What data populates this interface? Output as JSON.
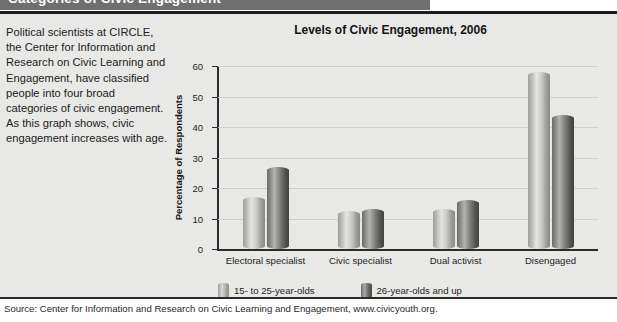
{
  "header": {
    "title": "Categories of Civic Engagement"
  },
  "blurb": {
    "text": "Political scientists at CIRCLE, the Center for Information and Research on Civic Learning and Engagement, have classified people into four broad categories of civic engagement. As this graph shows, civic engagement increases with age."
  },
  "source": {
    "text": "Source: Center for Information and Research on Civic Learning and Engagement, www.civicyouth.org."
  },
  "legend": {
    "items": [
      {
        "label": "15- to 25-year-olds",
        "swatch": "light"
      },
      {
        "label": "26-year-olds and up",
        "swatch": "dark"
      }
    ]
  },
  "colors": {
    "header_bar": "#6f6f6f",
    "panel": "#e8e8e6",
    "axis": "#2b2b2b",
    "grid": "#cfcfcd",
    "bar_light": "#c9c9c7",
    "bar_dark": "#6a6a68"
  },
  "chart_data": {
    "type": "bar",
    "title": "Levels of Civic Engagement, 2006",
    "xlabel": "",
    "ylabel": "Percentage of Respondents",
    "ylim": [
      0,
      60
    ],
    "yticks": [
      0,
      10,
      20,
      30,
      40,
      50,
      60
    ],
    "grid": true,
    "legend_position": "bottom",
    "categories": [
      "Electoral specialist",
      "Civic specialist",
      "Dual activist",
      "Disengaged"
    ],
    "series": [
      {
        "name": "15- to 25-year-olds",
        "values": [
          17,
          12.5,
          13,
          58
        ]
      },
      {
        "name": "26-year-olds and up",
        "values": [
          27,
          13,
          16,
          44
        ]
      }
    ]
  }
}
